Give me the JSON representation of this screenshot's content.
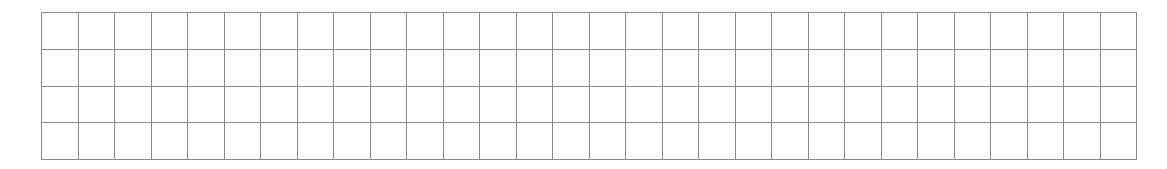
{
  "grid": {
    "rows": 4,
    "columns": 30,
    "line_color": "#8a8a8a",
    "background_color": "#ffffff",
    "cells_content": "empty"
  }
}
